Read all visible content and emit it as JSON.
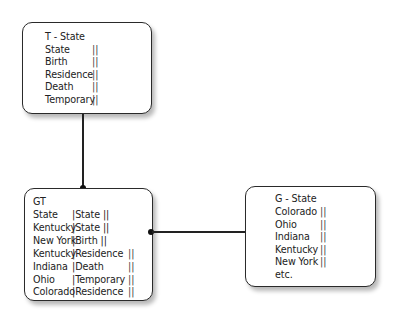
{
  "diagram": {
    "t_state": {
      "title": "T - State",
      "rows": [
        {
          "label": "State",
          "bars": "||"
        },
        {
          "label": "Birth",
          "bars": "||"
        },
        {
          "label": "Residence",
          "bars": "||"
        },
        {
          "label": "Death",
          "bars": "||"
        },
        {
          "label": "Temporary",
          "bars": "||"
        }
      ]
    },
    "gt": {
      "title": "GT",
      "rows": [
        {
          "col1": "State",
          "col2": "|State ||",
          "bars": ""
        },
        {
          "col1": "Kentucky",
          "col2": "|State ||",
          "bars": ""
        },
        {
          "col1": "New York",
          "col2": "|Birth ||",
          "bars": ""
        },
        {
          "col1": "Kentucky",
          "col2": "|Residence",
          "bars": "||"
        },
        {
          "col1": "Indiana",
          "col2": "|Death",
          "bars": "||"
        },
        {
          "col1": "Ohio",
          "col2": "|Temporary",
          "bars": "||"
        },
        {
          "col1": "Colorado",
          "col2": "|Residence",
          "bars": "||"
        }
      ]
    },
    "g_state": {
      "title": "G - State",
      "rows": [
        {
          "label": "Colorado",
          "bars": "||"
        },
        {
          "label": "Ohio",
          "bars": "||"
        },
        {
          "label": "Indiana",
          "bars": "||"
        },
        {
          "label": "Kentucky",
          "bars": "||"
        },
        {
          "label": "New York",
          "bars": "||"
        },
        {
          "label": "etc.",
          "bars": ""
        }
      ]
    },
    "colors": {
      "border": "#2a2a2a",
      "connector": "#222222",
      "background": "#ffffff"
    }
  }
}
